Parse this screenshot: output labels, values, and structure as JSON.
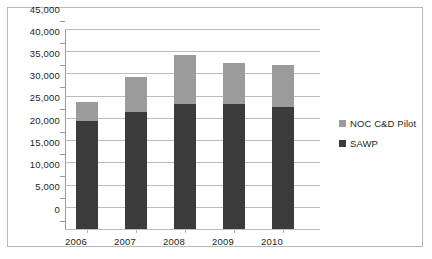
{
  "chart_data": {
    "type": "bar",
    "title": "",
    "subtitle": "",
    "xlabel": "",
    "ylabel": "",
    "stacked": true,
    "grid": true,
    "legend_position": "right",
    "ylim": [
      0,
      45000
    ],
    "ytick_interval": 5000,
    "categories": [
      "2006",
      "2007",
      "2008",
      "2009",
      "2010"
    ],
    "ytick_labels": [
      "0",
      "5,000",
      "10,000",
      "15,000",
      "20,000",
      "25,000",
      "30,000",
      "35,000",
      "40,000",
      "45,000"
    ],
    "ytick_values": [
      0,
      5000,
      10000,
      15000,
      20000,
      25000,
      30000,
      35000,
      40000,
      45000
    ],
    "series": [
      {
        "name": "SAWP",
        "color": "#3b3b3b",
        "values": [
          24200,
          26300,
          28100,
          28200,
          27500
        ]
      },
      {
        "name": "NOC C&D Pilot",
        "color": "#9b9b9b",
        "values": [
          4300,
          7900,
          11000,
          9100,
          9400
        ]
      }
    ],
    "totals": [
      28500,
      34200,
      39100,
      37300,
      36900
    ],
    "legend": [
      {
        "label": "NOC C&D Pilot",
        "color": "#9b9b9b"
      },
      {
        "label": "SAWP",
        "color": "#3b3b3b"
      }
    ]
  },
  "colors": {
    "series_top": "#9b9b9b",
    "series_bottom": "#3b3b3b",
    "gridline": "#bcbcbc",
    "axis": "#9a9a9a",
    "frame": "#b9b9b9",
    "text": "#231f20",
    "background": "#ffffff"
  }
}
